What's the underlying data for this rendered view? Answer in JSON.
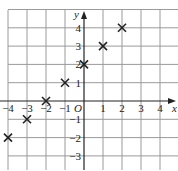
{
  "chart_data": {
    "type": "scatter",
    "title": "",
    "xlabel": "x",
    "ylabel": "y",
    "origin_label": "O",
    "xlim": [
      -4.3,
      4.9
    ],
    "ylim": [
      -3.5,
      5
    ],
    "grid": true,
    "marker": "x",
    "x_ticks": [
      -4,
      -3,
      -2,
      -1,
      1,
      2,
      3,
      4
    ],
    "x_tick_labels": [
      "−4",
      "−3",
      "−2",
      "−1",
      "1",
      "2",
      "3",
      "4"
    ],
    "y_ticks": [
      4,
      3,
      2,
      1,
      -1,
      -2,
      -3
    ],
    "y_tick_labels": [
      "4",
      "3",
      "2",
      "1",
      "−1",
      "−2",
      "−3"
    ],
    "points": [
      {
        "x": -4,
        "y": -2
      },
      {
        "x": -3,
        "y": -1
      },
      {
        "x": -2,
        "y": 0
      },
      {
        "x": -1,
        "y": 1
      },
      {
        "x": 0,
        "y": 2
      },
      {
        "x": 1,
        "y": 3
      },
      {
        "x": 2,
        "y": 4
      }
    ],
    "colors": {
      "grid": "#9a9a9a",
      "axis": "#222222",
      "marker": "#222222"
    }
  }
}
